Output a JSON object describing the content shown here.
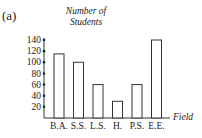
{
  "panel_label": "(a)",
  "chart_data": {
    "type": "bar",
    "title": "",
    "xlabel": "Field",
    "ylabel": "Number of Students",
    "categories": [
      "B.A.",
      "S.S.",
      "L.S.",
      "H.",
      "P.S.",
      "E.E."
    ],
    "values": [
      115,
      100,
      60,
      30,
      60,
      140
    ],
    "ylim": [
      0,
      140
    ],
    "yticks": [
      20,
      40,
      60,
      80,
      100,
      120,
      140
    ],
    "grid": false,
    "legend": null,
    "bar_fill": "#ffffff",
    "bar_stroke": "#333333"
  }
}
